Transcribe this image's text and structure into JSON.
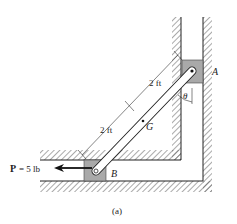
{
  "figure": {
    "caption": "(a)",
    "labels": {
      "point_a": "A",
      "point_b": "B",
      "center_g": "G",
      "angle": "θ",
      "dim_upper": "2 ft",
      "dim_lower": "2 ft",
      "force_symbol": "P",
      "force_value": "= 5 lb"
    },
    "colors": {
      "block_fill": "#a9a9a9",
      "line": "#222222",
      "hatch": "#555555"
    }
  }
}
